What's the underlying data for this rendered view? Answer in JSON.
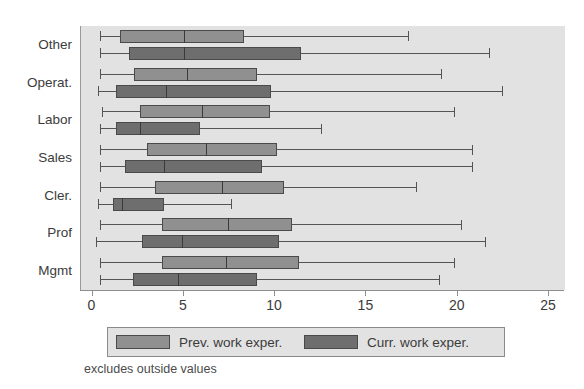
{
  "chart_data": {
    "type": "box",
    "title": "",
    "xlabel": "",
    "ylabel": "",
    "xlim": [
      0,
      25
    ],
    "xticks": [
      0,
      5,
      10,
      15,
      20,
      25
    ],
    "xtick_labels": [
      "0",
      "5",
      "10",
      "15",
      "20",
      "25"
    ],
    "grid": false,
    "note": "excludes outside values",
    "legend": {
      "position": "bottom",
      "entries": [
        {
          "name": "prev",
          "label": "Prev. work exper.",
          "color": "#909090"
        },
        {
          "name": "curr",
          "label": "Curr. work exper.",
          "color": "#6e6e6e"
        }
      ]
    },
    "categories": [
      "Other",
      "Operat.",
      "Labor",
      "Sales",
      "Cler.",
      "Prof",
      "Mgmt"
    ],
    "series": [
      {
        "name": "prev",
        "label": "Prev. work exper.",
        "color": "#909090",
        "boxes": [
          {
            "category": "Other",
            "whisker_low": 0.4,
            "q1": 1.5,
            "median": 5.0,
            "q3": 8.3,
            "whisker_high": 17.3
          },
          {
            "category": "Operat.",
            "whisker_low": 0.4,
            "q1": 2.3,
            "median": 5.2,
            "q3": 9.0,
            "whisker_high": 19.1
          },
          {
            "category": "Labor",
            "whisker_low": 0.5,
            "q1": 2.6,
            "median": 6.0,
            "q3": 9.7,
            "whisker_high": 19.8
          },
          {
            "category": "Sales",
            "whisker_low": 0.4,
            "q1": 3.0,
            "median": 6.2,
            "q3": 10.1,
            "whisker_high": 20.8
          },
          {
            "category": "Cler.",
            "whisker_low": 0.4,
            "q1": 3.4,
            "median": 7.1,
            "q3": 10.5,
            "whisker_high": 17.7
          },
          {
            "category": "Prof",
            "whisker_low": 0.4,
            "q1": 3.8,
            "median": 7.4,
            "q3": 10.9,
            "whisker_high": 20.2
          },
          {
            "category": "Mgmt",
            "whisker_low": 0.4,
            "q1": 3.8,
            "median": 7.3,
            "q3": 11.3,
            "whisker_high": 19.8
          }
        ]
      },
      {
        "name": "curr",
        "label": "Curr. work exper.",
        "color": "#6e6e6e",
        "boxes": [
          {
            "category": "Other",
            "whisker_low": 0.4,
            "q1": 2.0,
            "median": 5.0,
            "q3": 11.4,
            "whisker_high": 21.7
          },
          {
            "category": "Operat.",
            "whisker_low": 0.3,
            "q1": 1.3,
            "median": 4.0,
            "q3": 9.8,
            "whisker_high": 22.4
          },
          {
            "category": "Labor",
            "whisker_low": 0.4,
            "q1": 1.3,
            "median": 2.6,
            "q3": 5.9,
            "whisker_high": 12.5
          },
          {
            "category": "Sales",
            "whisker_low": 0.4,
            "q1": 1.8,
            "median": 3.9,
            "q3": 9.3,
            "whisker_high": 20.8
          },
          {
            "category": "Cler.",
            "whisker_low": 0.3,
            "q1": 1.1,
            "median": 1.6,
            "q3": 3.9,
            "whisker_high": 7.6
          },
          {
            "category": "Prof",
            "whisker_low": 0.2,
            "q1": 2.7,
            "median": 4.9,
            "q3": 10.2,
            "whisker_high": 21.5
          },
          {
            "category": "Mgmt",
            "whisker_low": 0.4,
            "q1": 2.2,
            "median": 4.7,
            "q3": 9.0,
            "whisker_high": 19.0
          }
        ]
      }
    ]
  }
}
